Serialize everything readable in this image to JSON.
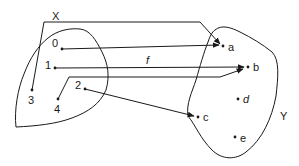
{
  "diagram": {
    "type": "function-mapping",
    "sets": {
      "domain": {
        "label": "X",
        "elements": [
          "0",
          "1",
          "2",
          "3",
          "4"
        ]
      },
      "codomain": {
        "label": "Y",
        "elements": [
          "a",
          "b",
          "c",
          "d",
          "e"
        ]
      }
    },
    "function_label": "f",
    "mappings": [
      {
        "from": "0",
        "to": "a"
      },
      {
        "from": "1",
        "to": "b"
      },
      {
        "from": "2",
        "to": "c"
      },
      {
        "from": "3",
        "to": "a"
      },
      {
        "from": "4",
        "to": "b"
      }
    ],
    "labels": {
      "X": "X",
      "Y": "Y",
      "f": "f",
      "d0": "0",
      "d1": "1",
      "d2": "2",
      "d3": "3",
      "d4": "4",
      "ca": "a",
      "cb": "b",
      "cc": "c",
      "cd": "d",
      "ce": "e"
    },
    "colors": {
      "ink": "#1a1a1a",
      "background": "#ffffff"
    }
  }
}
